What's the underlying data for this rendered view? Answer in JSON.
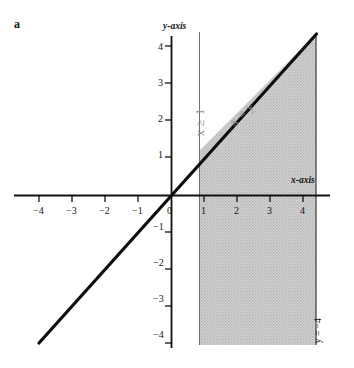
{
  "panel": {
    "label": "a"
  },
  "axes": {
    "x_axis_name": "x-axis",
    "y_axis_name": "y-axis"
  },
  "annotations": {
    "constraint_x": "x ≥ 1",
    "line_equation": "x = y",
    "bottom_bound": "y = −4"
  },
  "chart_data": {
    "type": "line",
    "title": "",
    "xlabel": "x-axis",
    "ylabel": "y-axis",
    "xlim": [
      -4.6,
      4.7
    ],
    "ylim": [
      -4.5,
      4.4
    ],
    "grid": false,
    "legend": "none",
    "x_ticks": [
      -4,
      -3,
      -2,
      -1,
      0,
      1,
      2,
      3,
      4
    ],
    "x_tick_labels": [
      "−4",
      "−3",
      "−2",
      "−1",
      "0",
      "1",
      "2",
      "3",
      "4"
    ],
    "y_ticks": [
      -4,
      -3,
      -2,
      -1,
      1,
      2,
      3,
      4
    ],
    "y_tick_labels": [
      "−4",
      "−3",
      "−2",
      "−1",
      "1",
      "2",
      "3",
      "4"
    ],
    "series": [
      {
        "name": "x = y",
        "type": "line",
        "style": "thick-solid",
        "color": "#000000",
        "x": [
          -4.0,
          4.25
        ],
        "y": [
          -4.0,
          4.25
        ]
      },
      {
        "name": "x = 1",
        "type": "vline",
        "style": "thin-solid",
        "color": "#555555",
        "x": [
          1,
          1
        ],
        "y": [
          4.3,
          -4.35
        ]
      },
      {
        "name": "x = 4.25 boundary",
        "type": "vline",
        "style": "thin-solid",
        "color": "#333333",
        "x": [
          4.25,
          4.25
        ],
        "y": [
          4.25,
          -4.35
        ]
      }
    ],
    "shaded_region": {
      "name": "integration region",
      "fill": "#c9c9c9",
      "description": "Region bounded left by x = 1, above by x = y, right by x = 4.25, below by y = −4",
      "vertices": [
        [
          1,
          1
        ],
        [
          4.25,
          4.25
        ],
        [
          4.25,
          -4.35
        ],
        [
          1,
          -4.35
        ]
      ]
    }
  },
  "tick_labels": {
    "x": [
      {
        "text": "−4",
        "left": 33,
        "top": 206
      },
      {
        "text": "−3",
        "left": 66,
        "top": 206
      },
      {
        "text": "−2",
        "left": 99,
        "top": 206
      },
      {
        "text": "−1",
        "left": 132,
        "top": 206
      },
      {
        "text": "0",
        "left": 167,
        "top": 206
      },
      {
        "text": "1",
        "left": 201,
        "top": 206
      },
      {
        "text": "2",
        "left": 234,
        "top": 206
      },
      {
        "text": "3",
        "left": 267,
        "top": 206
      },
      {
        "text": "4",
        "left": 300,
        "top": 206
      }
    ],
    "y": [
      {
        "text": "4",
        "left": 158,
        "top": 42
      },
      {
        "text": "3",
        "left": 158,
        "top": 78
      },
      {
        "text": "2",
        "left": 158,
        "top": 114
      },
      {
        "text": "1",
        "left": 158,
        "top": 150
      },
      {
        "text": "−1",
        "left": 153,
        "top": 222
      },
      {
        "text": "−2",
        "left": 153,
        "top": 258
      },
      {
        "text": "−3",
        "left": 153,
        "top": 294
      },
      {
        "text": "−4",
        "left": 153,
        "top": 330
      }
    ]
  }
}
